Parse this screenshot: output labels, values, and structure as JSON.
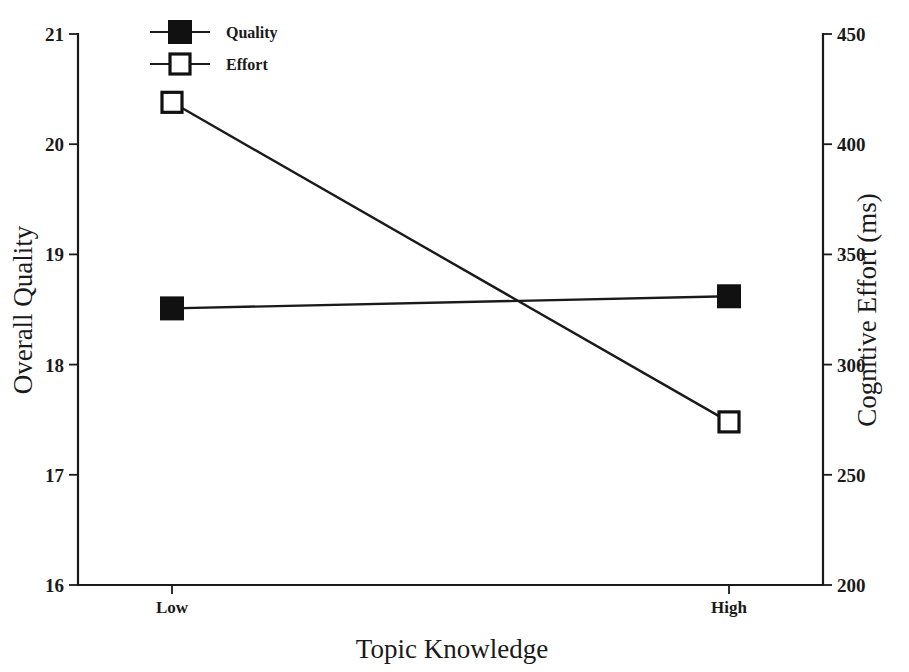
{
  "chart_data": {
    "type": "line",
    "title": "",
    "xlabel": "Topic Knowledge",
    "categories": [
      "Low",
      "High"
    ],
    "grid": false,
    "legend_position": "top-center-left",
    "axes": {
      "left": {
        "label": "Overall Quality",
        "ticks": [
          "21",
          "20",
          "19",
          "18",
          "17",
          "16"
        ],
        "tick_values": [
          21,
          20,
          19,
          18,
          17,
          16
        ],
        "ylim": [
          16,
          21
        ]
      },
      "right": {
        "label": "Cognitive Effort (ms)",
        "ticks": [
          "450",
          "400",
          "350",
          "300",
          "250",
          "200"
        ],
        "tick_values": [
          450,
          400,
          350,
          300,
          250,
          200
        ],
        "ylim": [
          200,
          450
        ]
      }
    },
    "series": [
      {
        "name": "Quality",
        "axis": "left",
        "marker": "filled-square",
        "values": [
          18.51,
          18.62
        ]
      },
      {
        "name": "Effort",
        "axis": "right",
        "marker": "open-square",
        "values": [
          419,
          274
        ]
      }
    ],
    "legend": [
      {
        "label": "Quality",
        "marker": "filled-square"
      },
      {
        "label": "Effort",
        "marker": "open-square"
      }
    ]
  }
}
